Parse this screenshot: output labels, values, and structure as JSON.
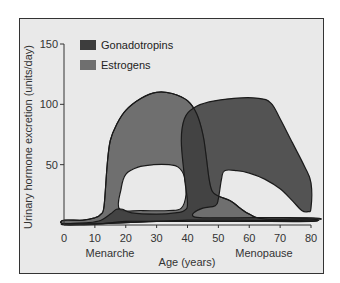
{
  "chart_data": {
    "type": "area",
    "title": "",
    "xlabel": "Age (years)",
    "ylabel": "Urinary hormone excretion (units/day)",
    "xlim": [
      0,
      80
    ],
    "ylim": [
      0,
      150
    ],
    "x_ticks": [
      0,
      10,
      20,
      30,
      40,
      50,
      60,
      70,
      80
    ],
    "y_ticks": [
      50,
      100,
      150
    ],
    "grid": false,
    "legend": {
      "placement": "top-left",
      "entries": [
        {
          "name": "Gonadotropins",
          "color": "#3d3d3d"
        },
        {
          "name": "Estrogens",
          "color": "#6f6f6f"
        }
      ]
    },
    "annotations": [
      {
        "text": "Menarche",
        "x": 15
      },
      {
        "text": "Menopause",
        "x": 64
      }
    ],
    "series": [
      {
        "name": "Gonadotropins",
        "color": "#3d3d3d",
        "outline": [
          [
            0,
            1
          ],
          [
            8,
            2
          ],
          [
            12,
            4
          ],
          [
            15,
            9
          ],
          [
            17,
            13
          ],
          [
            19,
            13
          ],
          [
            22,
            10
          ],
          [
            30,
            9
          ],
          [
            36,
            10
          ],
          [
            39,
            12
          ],
          [
            40,
            18
          ],
          [
            39,
            40
          ],
          [
            38,
            70
          ],
          [
            39,
            88
          ],
          [
            42,
            97
          ],
          [
            47,
            102
          ],
          [
            55,
            105
          ],
          [
            63,
            105
          ],
          [
            67,
            101
          ],
          [
            70,
            88
          ],
          [
            74,
            68
          ],
          [
            78,
            48
          ],
          [
            80,
            35
          ],
          [
            80,
            14
          ],
          [
            79,
            11
          ],
          [
            77,
            12
          ],
          [
            74,
            20
          ],
          [
            70,
            30
          ],
          [
            65,
            38
          ],
          [
            60,
            43
          ],
          [
            56,
            45
          ],
          [
            52,
            45
          ],
          [
            51,
            38
          ],
          [
            50,
            22
          ],
          [
            49,
            16
          ],
          [
            45,
            14
          ],
          [
            42,
            10
          ],
          [
            42,
            7
          ],
          [
            45,
            6
          ],
          [
            55,
            6
          ],
          [
            80,
            6
          ],
          [
            80,
            4
          ],
          [
            55,
            4
          ],
          [
            45,
            4
          ],
          [
            40,
            4
          ],
          [
            30,
            3
          ],
          [
            20,
            3
          ],
          [
            12,
            1
          ],
          [
            5,
            0
          ],
          [
            0,
            0
          ]
        ]
      },
      {
        "name": "Estrogens",
        "color": "#6f6f6f",
        "outline": [
          [
            0,
            4
          ],
          [
            6,
            4
          ],
          [
            10,
            6
          ],
          [
            12,
            9
          ],
          [
            13,
            16
          ],
          [
            14,
            50
          ],
          [
            15,
            70
          ],
          [
            17,
            83
          ],
          [
            20,
            95
          ],
          [
            25,
            105
          ],
          [
            30,
            110
          ],
          [
            35,
            109
          ],
          [
            40,
            103
          ],
          [
            43,
            92
          ],
          [
            45,
            75
          ],
          [
            46,
            58
          ],
          [
            47,
            38
          ],
          [
            48,
            28
          ],
          [
            50,
            24
          ],
          [
            54,
            20
          ],
          [
            57,
            14
          ],
          [
            60,
            9
          ],
          [
            65,
            5
          ],
          [
            80,
            5
          ],
          [
            80,
            3
          ],
          [
            60,
            3
          ],
          [
            45,
            3
          ],
          [
            40,
            3
          ],
          [
            30,
            3
          ],
          [
            20,
            2
          ],
          [
            10,
            1
          ],
          [
            0,
            1
          ]
        ],
        "hole": [
          [
            18,
            13
          ],
          [
            18.5,
            30
          ],
          [
            20,
            42
          ],
          [
            24,
            48
          ],
          [
            29,
            50
          ],
          [
            34,
            50
          ],
          [
            37,
            48
          ],
          [
            39,
            40
          ],
          [
            39.5,
            25
          ],
          [
            38,
            14
          ],
          [
            34,
            12
          ],
          [
            25,
            12
          ]
        ]
      }
    ]
  }
}
